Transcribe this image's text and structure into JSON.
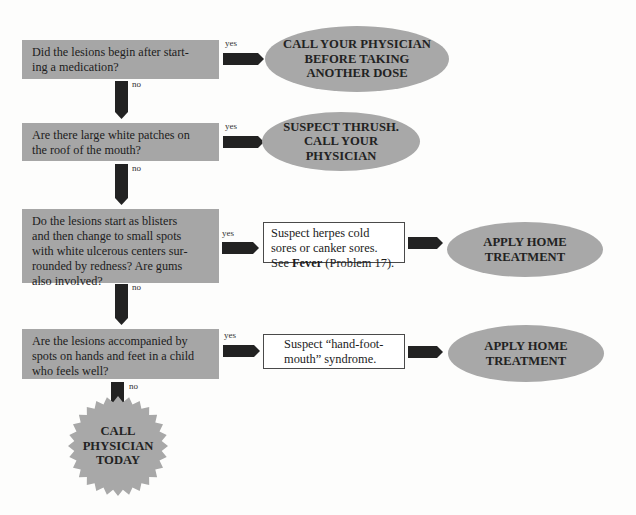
{
  "flowchart": {
    "colors": {
      "question_fill": "#a6a6a6",
      "outcome_fill": "#a8a8a8",
      "arrow_fill": "#222222",
      "info_box_fill": "#ffffff",
      "info_box_border": "#4a4a4a",
      "background": "#fdfdfc"
    },
    "questions": [
      {
        "text": "Did the lesions begin after starting a medication?",
        "yes_label": "yes",
        "no_label": "no"
      },
      {
        "text": "Are there large white patches on the roof of the mouth?",
        "yes_label": "yes",
        "no_label": "no"
      },
      {
        "text": "Do the lesions start as blisters and then change to small spots with white ulcerous centers surrounded by redness? Are gums also involved?",
        "yes_label": "yes",
        "no_label": "no"
      },
      {
        "text": "Are the lesions accompanied by spots on hands and feet in a child who feels well?",
        "yes_label": "yes",
        "no_label": "no"
      }
    ],
    "q1_lines": [
      "Did the lesions begin after start-",
      "ing a medication?"
    ],
    "q2_lines": [
      "Are there large white patches on",
      "the roof of the mouth?"
    ],
    "q3_lines": [
      "Do the lesions start as blisters",
      "and then change to small spots",
      "with white ulcerous centers sur-",
      "rounded by redness? Are gums",
      "also involved?"
    ],
    "q4_lines": [
      "Are the lesions accompanied by",
      "spots on hands and feet in a child",
      "who feels well?"
    ],
    "outcomes": {
      "q1_yes": {
        "lines": [
          "CALL YOUR PHYSICIAN",
          "BEFORE TAKING",
          "ANOTHER DOSE"
        ]
      },
      "q2_yes": {
        "lines": [
          "SUSPECT THRUSH.",
          "CALL YOUR",
          "PHYSICIAN"
        ]
      },
      "q3_yes_info": {
        "line1": "Suspect herpes cold",
        "line2": "sores or canker sores.",
        "line3_prefix": "See ",
        "line3_bold": "Fever",
        "line3_suffix": " (Problem 17)."
      },
      "q3_yes_action": {
        "lines": [
          "APPLY HOME",
          "TREATMENT"
        ]
      },
      "q4_yes_info": {
        "lines": [
          "Suspect “hand-foot-",
          "mouth” syndrome."
        ]
      },
      "q4_yes_action": {
        "lines": [
          "APPLY HOME",
          "TREATMENT"
        ]
      },
      "q4_no": {
        "lines": [
          "CALL",
          "PHYSICIAN",
          "TODAY"
        ]
      }
    }
  }
}
